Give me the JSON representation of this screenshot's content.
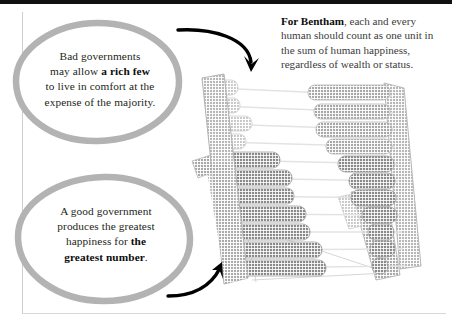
{
  "page": {
    "background_color": "#ffffff",
    "top_rule_color": "#111111",
    "rule_color": "#cfcfcf"
  },
  "callouts": [
    {
      "id": "bad-governments",
      "name": "bubble-bad-governments",
      "outline_color": "#b3b3b3",
      "text_plain": "Bad governments may allow a rich few to live in comfort at the expense of the majority.",
      "text_html": "Bad governments<br>may allow <b>a rich few</b><br>to live in comfort at the<br>expense of the majority.",
      "lines": [
        "Bad governments",
        "may allow a rich few",
        "to live in comfort at the",
        "expense of the majority."
      ],
      "emphasis": "a rich few"
    },
    {
      "id": "good-government",
      "name": "bubble-good-government",
      "outline_color": "#b3b3b3",
      "text_plain": "A good government produces the greatest happiness for the greatest number.",
      "text_html": "A good government<br>produces the greatest<br>happiness for <b>the<br>greatest number</b>.",
      "lines": [
        "A good government",
        "produces the greatest",
        "happiness for the",
        "greatest number."
      ],
      "emphasis": "the greatest number"
    }
  ],
  "note": {
    "name": "bentham-note",
    "lead": "For Bentham",
    "text_plain": "For Bentham, each and every human should count as one unit in the sum of human happiness, regardless of wealth or status.",
    "text_html": "<b>For Bentham</b>, each and every human should count as one unit in the sum of human happiness, regardless of wealth or status.",
    "lines": [
      "For Bentham, each and",
      "every human should count",
      "as one unit in the sum of",
      "human happiness, regardless",
      "of wealth or status."
    ],
    "color": "#3b3b3b"
  },
  "arrows": [
    {
      "id": "arrow-top",
      "name": "arrow-note-to-abacus",
      "color": "#000000",
      "description": "curves from the upper-left bubble rightward then hooks down into the abacus"
    },
    {
      "id": "arrow-bottom",
      "name": "arrow-bubble-to-abacus",
      "color": "#000000",
      "description": "curves from the lower-left bubble rightward and up into the abacus"
    }
  ],
  "illustration": {
    "name": "abacus-illustration",
    "alt": "A tilted wooden abacus with eleven rows of beads on a folding stand",
    "frame_color": "#c9c9c9",
    "frame_shade_color": "#a8a8a8",
    "bead_light_color": "#cdcdcd",
    "bead_dark_color": "#9a9a9a",
    "rod_color": "#e2e2e2",
    "rows": [
      {
        "index": 1,
        "left_beads": 2,
        "right_beads": 8,
        "tone": "light"
      },
      {
        "index": 2,
        "left_beads": 2,
        "right_beads": 7,
        "tone": "light"
      },
      {
        "index": 3,
        "left_beads": 3,
        "right_beads": 7,
        "tone": "light"
      },
      {
        "index": 4,
        "left_beads": 2,
        "right_beads": 6,
        "tone": "light"
      },
      {
        "index": 5,
        "left_beads": 5,
        "right_beads": 5,
        "tone": "dark"
      },
      {
        "index": 6,
        "left_beads": 6,
        "right_beads": 4,
        "tone": "dark"
      },
      {
        "index": 7,
        "left_beads": 6,
        "right_beads": 4,
        "tone": "dark"
      },
      {
        "index": 8,
        "left_beads": 7,
        "right_beads": 3,
        "tone": "dark"
      },
      {
        "index": 9,
        "left_beads": 7,
        "right_beads": 2,
        "tone": "dark"
      },
      {
        "index": 10,
        "left_beads": 8,
        "right_beads": 2,
        "tone": "dark"
      },
      {
        "index": 11,
        "left_beads": 8,
        "right_beads": 1,
        "tone": "dark"
      }
    ],
    "row_count": 11,
    "has_stand": true,
    "has_left_foot": true
  }
}
